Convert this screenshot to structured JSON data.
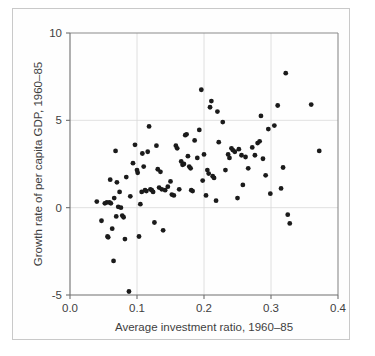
{
  "figure": {
    "background_color": "#ffffff",
    "frame_color": "#c9c9c9",
    "point_color": "#1b1b1b",
    "axis_color": "#6e6e6e",
    "grid_color": "#d8d8d8"
  },
  "axis": {
    "x_ticks": [
      "0.0",
      "0.1",
      "0.2",
      "0.3",
      "0.4"
    ],
    "y_ticks": [
      "10",
      "5",
      "0",
      "-5"
    ],
    "x_title": "Average investment ratio, 1960–85",
    "y_title": "Growth rate of per capita GDP, 1960–85"
  },
  "chart_data": {
    "type": "scatter",
    "title": "",
    "xlabel": "Average investment ratio, 1960–85",
    "ylabel": "Growth rate of per capita GDP, 1960–85",
    "xlim": [
      0.0,
      0.4
    ],
    "ylim": [
      -5,
      10
    ],
    "xticks": [
      0.0,
      0.1,
      0.2,
      0.3,
      0.4
    ],
    "yticks": [
      -5,
      0,
      5,
      10
    ],
    "grid": true,
    "legend": null,
    "series": [
      {
        "name": "Countries",
        "points": [
          [
            0.04,
            0.35
          ],
          [
            0.047,
            -0.75
          ],
          [
            0.052,
            0.25
          ],
          [
            0.055,
            0.3
          ],
          [
            0.056,
            -1.65
          ],
          [
            0.057,
            -1.7
          ],
          [
            0.059,
            0.3
          ],
          [
            0.06,
            1.6
          ],
          [
            0.061,
            0.25
          ],
          [
            0.063,
            -1.2
          ],
          [
            0.065,
            -3.05
          ],
          [
            0.066,
            0.55
          ],
          [
            0.068,
            3.25
          ],
          [
            0.069,
            -0.5
          ],
          [
            0.07,
            1.45
          ],
          [
            0.072,
            0.05
          ],
          [
            0.074,
            0.9
          ],
          [
            0.076,
            0.0
          ],
          [
            0.078,
            -0.45
          ],
          [
            0.08,
            -0.55
          ],
          [
            0.082,
            -1.8
          ],
          [
            0.084,
            1.75
          ],
          [
            0.088,
            -4.8
          ],
          [
            0.09,
            0.65
          ],
          [
            0.094,
            2.55
          ],
          [
            0.097,
            3.6
          ],
          [
            0.1,
            2.15
          ],
          [
            0.101,
            2.0
          ],
          [
            0.103,
            -1.65
          ],
          [
            0.105,
            0.2
          ],
          [
            0.107,
            0.9
          ],
          [
            0.108,
            3.1
          ],
          [
            0.11,
            2.35
          ],
          [
            0.112,
            1.0
          ],
          [
            0.114,
            0.95
          ],
          [
            0.116,
            3.2
          ],
          [
            0.118,
            4.65
          ],
          [
            0.12,
            1.05
          ],
          [
            0.122,
            1.0
          ],
          [
            0.124,
            0.9
          ],
          [
            0.126,
            -0.85
          ],
          [
            0.129,
            3.55
          ],
          [
            0.131,
            2.2
          ],
          [
            0.133,
            1.15
          ],
          [
            0.135,
            2.05
          ],
          [
            0.137,
            1.05
          ],
          [
            0.139,
            -1.3
          ],
          [
            0.142,
            1.0
          ],
          [
            0.146,
            1.2
          ],
          [
            0.15,
            1.5
          ],
          [
            0.152,
            0.75
          ],
          [
            0.155,
            0.7
          ],
          [
            0.158,
            3.55
          ],
          [
            0.16,
            3.4
          ],
          [
            0.163,
            1.05
          ],
          [
            0.166,
            2.65
          ],
          [
            0.168,
            2.45
          ],
          [
            0.17,
            2.5
          ],
          [
            0.172,
            4.15
          ],
          [
            0.174,
            4.2
          ],
          [
            0.176,
            2.95
          ],
          [
            0.178,
            2.35
          ],
          [
            0.18,
            2.25
          ],
          [
            0.181,
            1.0
          ],
          [
            0.183,
            0.95
          ],
          [
            0.186,
            3.85
          ],
          [
            0.19,
            2.85
          ],
          [
            0.193,
            4.45
          ],
          [
            0.196,
            6.75
          ],
          [
            0.198,
            1.55
          ],
          [
            0.2,
            3.05
          ],
          [
            0.203,
            0.7
          ],
          [
            0.205,
            2.15
          ],
          [
            0.207,
            1.95
          ],
          [
            0.209,
            5.75
          ],
          [
            0.211,
            6.1
          ],
          [
            0.213,
            1.8
          ],
          [
            0.215,
            1.7
          ],
          [
            0.218,
            0.4
          ],
          [
            0.22,
            5.5
          ],
          [
            0.222,
            3.75
          ],
          [
            0.228,
            4.9
          ],
          [
            0.232,
            2.15
          ],
          [
            0.236,
            3.05
          ],
          [
            0.238,
            2.85
          ],
          [
            0.241,
            3.4
          ],
          [
            0.243,
            3.3
          ],
          [
            0.246,
            3.2
          ],
          [
            0.25,
            0.55
          ],
          [
            0.252,
            3.35
          ],
          [
            0.256,
            3.0
          ],
          [
            0.258,
            1.3
          ],
          [
            0.262,
            2.9
          ],
          [
            0.266,
            2.25
          ],
          [
            0.272,
            3.45
          ],
          [
            0.276,
            3.0
          ],
          [
            0.28,
            3.7
          ],
          [
            0.283,
            3.8
          ],
          [
            0.285,
            5.25
          ],
          [
            0.288,
            2.8
          ],
          [
            0.292,
            1.85
          ],
          [
            0.296,
            4.5
          ],
          [
            0.299,
            0.8
          ],
          [
            0.305,
            4.7
          ],
          [
            0.31,
            5.85
          ],
          [
            0.315,
            1.1
          ],
          [
            0.318,
            2.3
          ],
          [
            0.322,
            7.7
          ],
          [
            0.325,
            -0.4
          ],
          [
            0.328,
            -0.9
          ],
          [
            0.36,
            5.9
          ],
          [
            0.372,
            3.25
          ]
        ]
      }
    ]
  }
}
